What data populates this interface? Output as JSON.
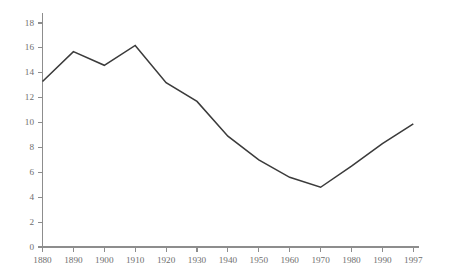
{
  "chart_data": {
    "type": "line",
    "title": "",
    "subtitle": "",
    "xlabel": "",
    "ylabel": "",
    "x": [
      1880,
      1890,
      1900,
      1910,
      1920,
      1930,
      1940,
      1950,
      1960,
      1970,
      1980,
      1990,
      1997
    ],
    "categories": [
      "1880",
      "1890",
      "1900",
      "1910",
      "1920",
      "1930",
      "1940",
      "1950",
      "1960",
      "1970",
      "1980",
      "1990",
      "1997"
    ],
    "values": [
      13.3,
      15.7,
      14.6,
      16.2,
      13.2,
      11.7,
      8.9,
      7.0,
      5.6,
      4.8,
      6.5,
      8.3,
      9.9
    ],
    "series": [
      {
        "name": "",
        "values": [
          13.3,
          15.7,
          14.6,
          16.2,
          13.2,
          11.7,
          8.9,
          7.0,
          5.6,
          4.8,
          6.5,
          8.3,
          9.9
        ]
      }
    ],
    "xtick_labels": [
      "1880",
      "1890",
      "1900",
      "1910",
      "1920",
      "1930",
      "1940",
      "1950",
      "1960",
      "1970",
      "1980",
      "1990",
      "1997"
    ],
    "ytick_labels": [
      "0",
      "2",
      "4",
      "6",
      "8",
      "10",
      "12",
      "14",
      "16",
      "18"
    ],
    "ytick_values": [
      0,
      2,
      4,
      6,
      8,
      10,
      12,
      14,
      16,
      18
    ],
    "ylim": [
      0,
      18
    ],
    "grid": false,
    "legend": false,
    "legend_position": "none",
    "annotations": [],
    "line_color": "#3b3b3b",
    "axis_color": "#8d8d8d",
    "label_color": "#6e6e6e",
    "background_color": "#ffffff"
  }
}
